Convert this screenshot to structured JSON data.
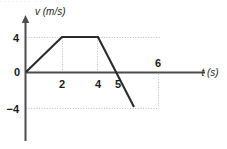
{
  "figure": {
    "name": "velocity-time-graph",
    "background_color": "#ffffff",
    "line_color": "#2b2b2b",
    "axis_color": "#4d4d4d",
    "grid_color": "#bdbdbd",
    "top_artifact_text": "........  ..  .  ."
  },
  "axes": {
    "y_axis_title": "v (m/s)",
    "x_axis_title": "t (s)",
    "origin_label": "0"
  },
  "y_ticks": [
    {
      "label": "4",
      "value": 4
    },
    {
      "label": "−4",
      "value": -4
    }
  ],
  "x_ticks": [
    {
      "label": "2",
      "value": 2
    },
    {
      "label": "4",
      "value": 4
    },
    {
      "label": "5",
      "value": 5
    },
    {
      "label": "6",
      "value": 6
    }
  ],
  "chart_data": {
    "type": "line",
    "title": "",
    "subtitle": "",
    "xlabel": "t (s)",
    "ylabel": "v (m/s)",
    "xlim": [
      0,
      7.2
    ],
    "ylim": [
      -5.6,
      5.2
    ],
    "grid": true,
    "grid_style": "dotted",
    "legend": false,
    "legend_position": "none",
    "xticks": [
      2,
      4,
      5,
      6
    ],
    "xticklabels": [
      "2",
      "4",
      "5",
      "6"
    ],
    "yticks": [
      4,
      -4
    ],
    "yticklabels": [
      "4",
      "−4"
    ],
    "series": [
      {
        "name": "velocity",
        "x": [
          0,
          2,
          4,
          6
        ],
        "y": [
          0,
          4,
          4,
          -4
        ],
        "color": "#2b2b2b"
      }
    ],
    "annotations": [
      {
        "text": "x-intercept at t = 5 s",
        "x": 5,
        "y": 0
      }
    ],
    "segments": [
      {
        "from_t": 0,
        "to_t": 2,
        "from_v": 0,
        "to_v": 4,
        "description": "uniform acceleration +2 m/s²"
      },
      {
        "from_t": 2,
        "to_t": 4,
        "from_v": 4,
        "to_v": 4,
        "description": "constant velocity 4 m/s"
      },
      {
        "from_t": 4,
        "to_t": 6,
        "from_v": 4,
        "to_v": -4,
        "description": "uniform deceleration −4 m/s²"
      }
    ]
  }
}
